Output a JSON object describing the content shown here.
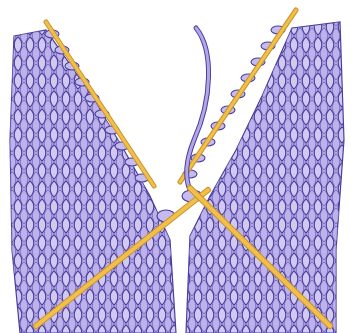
{
  "illustration": {
    "subject": "knitting-two-pieces-on-needles",
    "colors": {
      "background": "#ffffff",
      "fabric_fill": "#b3a6e6",
      "fabric_light": "#d2c9f3",
      "stitch_outline": "#4a3f9c",
      "needle": "#f2c04a",
      "needle_shadow": "#c8952a",
      "yarn": "#9d8fde"
    }
  }
}
